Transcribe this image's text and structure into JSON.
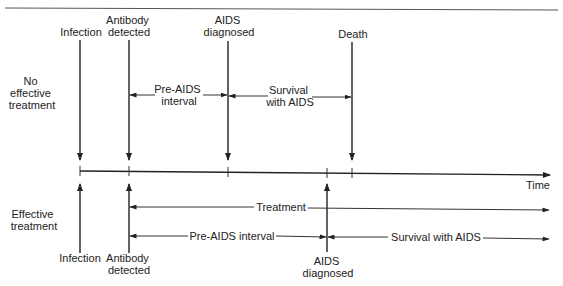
{
  "diagram": {
    "top_section_label": [
      "No",
      "effective",
      "treatment"
    ],
    "bottom_section_label": [
      "Effective",
      "treatment"
    ],
    "axis_label": "Time",
    "top_events": {
      "infection": [
        "Infection"
      ],
      "antibody": [
        "Antibody",
        "detected"
      ],
      "aids": [
        "AIDS",
        "diagnosed"
      ],
      "death": [
        "Death"
      ]
    },
    "top_intervals": {
      "pre_aids": [
        "Pre-AIDS",
        "interval"
      ],
      "survival": [
        "Survival",
        "with AIDS"
      ]
    },
    "bottom_events": {
      "infection": [
        "Infection"
      ],
      "antibody": [
        "Antibody",
        "detected"
      ],
      "aids": [
        "AIDS",
        "diagnosed"
      ]
    },
    "bottom_intervals": {
      "treatment": "Treatment",
      "pre_aids": "Pre-AIDS interval",
      "survival": "Survival with AIDS"
    }
  }
}
